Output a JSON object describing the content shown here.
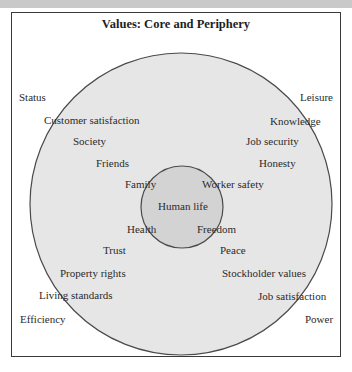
{
  "diagram": {
    "title": "Values: Core and Periphery",
    "colors": {
      "outer_fill": "#e6e6e6",
      "inner_fill": "#d3d3d3",
      "stroke": "#4a4a4a",
      "frame": "#3a3a3a",
      "top_strip": "#c9c9c9"
    },
    "core": {
      "label": "Human life"
    },
    "inner_ring": [
      "Family",
      "Worker safety",
      "Health",
      "Freedom"
    ],
    "middle_ring": [
      "Customer satisfaction",
      "Knowledge",
      "Society",
      "Job security",
      "Friends",
      "Honesty",
      "Trust",
      "Peace",
      "Property rights",
      "Stockholder values",
      "Living standards",
      "Job satisfaction"
    ],
    "periphery": [
      "Status",
      "Leisure",
      "Efficiency",
      "Power"
    ]
  }
}
